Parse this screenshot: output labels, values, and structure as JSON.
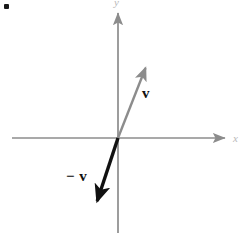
{
  "figure": {
    "background_color": "#ffffff",
    "bullet_mark": "",
    "axes": {
      "x_label": "x",
      "y_label": "y",
      "axis_color": "#8c8c8c",
      "origin": {
        "x": 118,
        "y": 138
      },
      "x_axis": {
        "start_x": 12,
        "end_x": 228,
        "y": 138
      },
      "y_axis": {
        "x": 118,
        "start_y": 10,
        "end_y": 233
      }
    },
    "vectors": [
      {
        "name": "v",
        "label": "v",
        "color": "#8c8c8c",
        "stroke_width": 2.4,
        "from": {
          "x": 118,
          "y": 138
        },
        "to": {
          "x": 148,
          "y": 62
        },
        "label_position": {
          "x": 142,
          "y": 86
        }
      },
      {
        "name": "-v",
        "label": "− v",
        "color": "#111111",
        "stroke_width": 3.4,
        "from": {
          "x": 118,
          "y": 138
        },
        "to": {
          "x": 95,
          "y": 208
        },
        "label_position": {
          "x": 66,
          "y": 169
        }
      }
    ]
  }
}
